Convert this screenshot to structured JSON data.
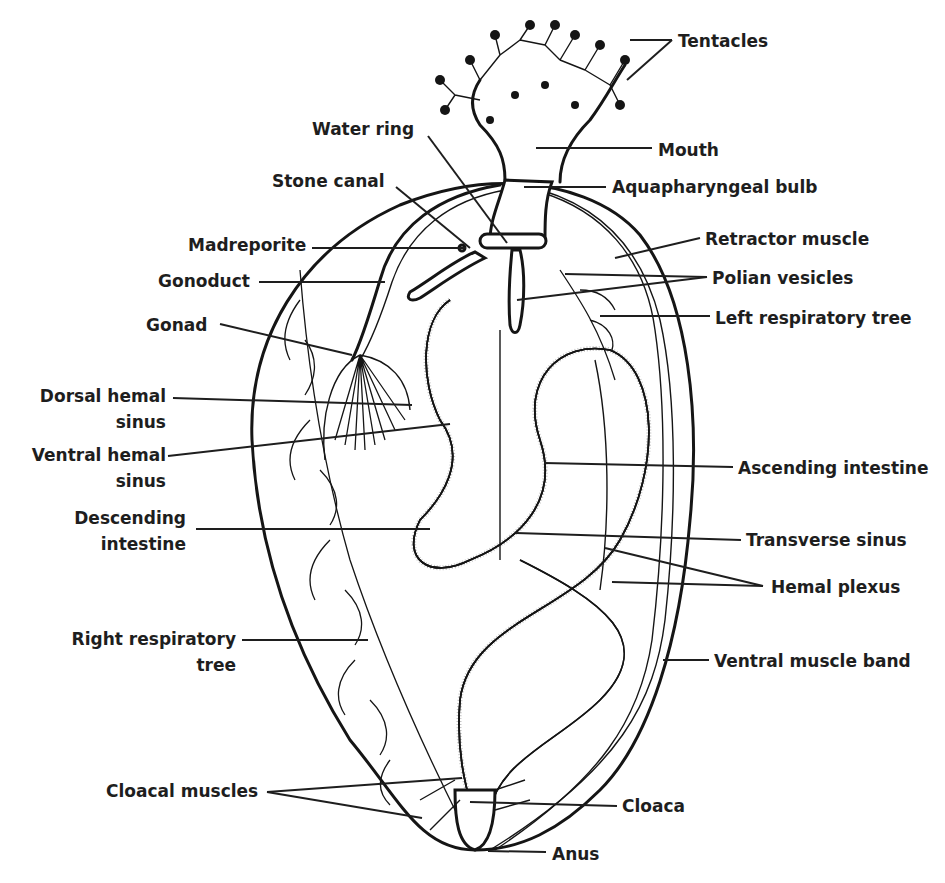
{
  "figure": {
    "background": "#ffffff",
    "ink_color": "#1e1e1e"
  },
  "labels": [
    {
      "id": "tentacles",
      "text": "Tentacles",
      "x": 678,
      "y": 47,
      "lines": [
        [
          630,
          40,
          672,
          40
        ],
        [
          627,
          80,
          672,
          40
        ]
      ]
    },
    {
      "id": "mouth",
      "text": "Mouth",
      "x": 658,
      "y": 156,
      "lines": [
        [
          536,
          148,
          652,
          148
        ]
      ]
    },
    {
      "id": "aquapharyngeal-bulb",
      "text": "Aquapharyngeal bulb",
      "x": 612,
      "y": 193,
      "lines": [
        [
          524,
          187,
          606,
          187
        ]
      ]
    },
    {
      "id": "retractor-muscle",
      "text": "Retractor muscle",
      "x": 705,
      "y": 245,
      "lines": [
        [
          615,
          258,
          700,
          238
        ]
      ]
    },
    {
      "id": "polian-vesicles",
      "text": "Polian vesicles",
      "x": 712,
      "y": 284,
      "lines": [
        [
          565,
          274,
          707,
          277
        ],
        [
          517,
          300,
          707,
          277
        ]
      ]
    },
    {
      "id": "left-respiratory-tree",
      "text": "Left respiratory tree",
      "x": 715,
      "y": 324,
      "lines": [
        [
          600,
          316,
          710,
          316
        ]
      ]
    },
    {
      "id": "water-ring",
      "text": "Water ring",
      "x": 312,
      "y": 135,
      "lines": [
        [
          428,
          136,
          507,
          243
        ]
      ]
    },
    {
      "id": "stone-canal",
      "text": "Stone canal",
      "x": 272,
      "y": 187,
      "lines": [
        [
          396,
          187,
          470,
          248
        ]
      ]
    },
    {
      "id": "madreporite",
      "text": "Madreporite",
      "x": 188,
      "y": 251,
      "lines": [
        [
          312,
          248,
          466,
          248
        ]
      ]
    },
    {
      "id": "gonoduct",
      "text": "Gonoduct",
      "x": 158,
      "y": 287,
      "lines": [
        [
          259,
          282,
          385,
          282
        ]
      ]
    },
    {
      "id": "gonad",
      "text": "Gonad",
      "x": 146,
      "y": 331,
      "lines": [
        [
          220,
          324,
          352,
          355
        ]
      ]
    },
    {
      "id": "dorsal-hemal-sinus",
      "text": [
        "Dorsal hemal",
        "sinus"
      ],
      "x": 166,
      "y": 402,
      "align": "end",
      "lines": [
        [
          173,
          398,
          412,
          405
        ]
      ]
    },
    {
      "id": "ventral-hemal-sinus",
      "text": [
        "Ventral hemal",
        "sinus"
      ],
      "x": 166,
      "y": 461,
      "align": "end",
      "lines": [
        [
          168,
          456,
          450,
          424
        ]
      ]
    },
    {
      "id": "descending-intestine",
      "text": [
        "Descending",
        "intestine"
      ],
      "x": 186,
      "y": 524,
      "align": "end",
      "lines": [
        [
          196,
          529,
          430,
          529
        ]
      ]
    },
    {
      "id": "ascending-intestine",
      "text": "Ascending intestine",
      "x": 738,
      "y": 474,
      "lines": [
        [
          544,
          463,
          733,
          467
        ]
      ]
    },
    {
      "id": "transverse-sinus",
      "text": "Transverse sinus",
      "x": 746,
      "y": 546,
      "lines": [
        [
          516,
          533,
          741,
          540
        ]
      ]
    },
    {
      "id": "hemal-plexus",
      "text": "Hemal plexus",
      "x": 771,
      "y": 593,
      "lines": [
        [
          605,
          548,
          763,
          586
        ],
        [
          612,
          582,
          763,
          586
        ]
      ]
    },
    {
      "id": "ventral-muscle-band",
      "text": "Ventral muscle band",
      "x": 714,
      "y": 667,
      "lines": [
        [
          663,
          660,
          709,
          660
        ]
      ]
    },
    {
      "id": "right-respiratory-tree",
      "text": [
        "Right respiratory",
        "tree"
      ],
      "x": 236,
      "y": 645,
      "align": "end",
      "lines": [
        [
          242,
          640,
          368,
          640
        ]
      ]
    },
    {
      "id": "cloacal-muscles",
      "text": "Cloacal muscles",
      "x": 106,
      "y": 797,
      "lines": [
        [
          267,
          792,
          462,
          778
        ],
        [
          267,
          792,
          422,
          818
        ]
      ]
    },
    {
      "id": "cloaca",
      "text": "Cloaca",
      "x": 622,
      "y": 812,
      "lines": [
        [
          470,
          802,
          617,
          806
        ]
      ]
    },
    {
      "id": "anus",
      "text": "Anus",
      "x": 552,
      "y": 860,
      "lines": [
        [
          488,
          851,
          546,
          852
        ]
      ]
    }
  ]
}
